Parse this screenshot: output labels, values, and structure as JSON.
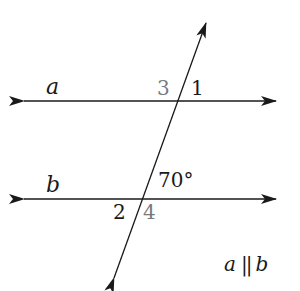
{
  "diagram": {
    "type": "parallel-lines-transversal",
    "lines": [
      {
        "name": "a",
        "label": "a"
      },
      {
        "name": "b",
        "label": "b"
      }
    ],
    "angle_labels": {
      "angle3": "3",
      "angle1": "1",
      "angle70": "70°",
      "angle2": "2",
      "angle4": "4"
    },
    "relation_label": {
      "left": "a",
      "symbol": "||",
      "right": "b"
    },
    "colors": {
      "line": "#1a1a1a",
      "highlight_label": "#7a7a7a",
      "label": "#1a1a1a"
    }
  }
}
